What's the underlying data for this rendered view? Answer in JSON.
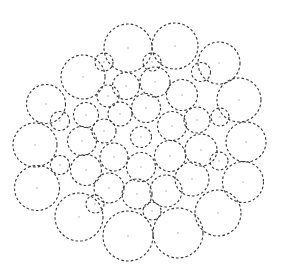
{
  "figure": {
    "name": "circle-packing-diagram",
    "type": "circle-packing",
    "canvas": {
      "width": 288,
      "height": 273,
      "background": "#ffffff"
    },
    "style": {
      "stroke_color": "#3a3a3a",
      "stroke_width": 1.15,
      "dash_pattern": "2.6 2.2",
      "fill": "none",
      "center_dot_color": "#c8c8c8",
      "center_dot_radius": 0.9
    },
    "circle_count": 43,
    "radius_range": [
      8.5,
      26.0
    ],
    "packing_center": [
      141,
      137
    ],
    "packing_radius": 131,
    "circles": [
      {
        "id": "c-center",
        "cx": 141,
        "cy": 137,
        "r": 10.5,
        "ring": 0
      },
      {
        "id": "c-r1-01",
        "cx": 120,
        "cy": 114,
        "r": 12.0,
        "ring": 1
      },
      {
        "id": "c-r1-02",
        "cx": 146,
        "cy": 108,
        "r": 14.5,
        "ring": 1
      },
      {
        "id": "c-r1-03",
        "cx": 172,
        "cy": 126,
        "r": 14.5,
        "ring": 1
      },
      {
        "id": "c-r1-04",
        "cx": 170,
        "cy": 156,
        "r": 15.5,
        "ring": 1
      },
      {
        "id": "c-r1-05",
        "cx": 141,
        "cy": 167,
        "r": 14.5,
        "ring": 1
      },
      {
        "id": "c-r1-06",
        "cx": 114,
        "cy": 157,
        "r": 14.0,
        "ring": 1
      },
      {
        "id": "c-r1-07",
        "cx": 104,
        "cy": 131,
        "r": 12.0,
        "ring": 1
      },
      {
        "id": "c-r2-01",
        "cx": 108,
        "cy": 96,
        "r": 11.0,
        "ring": 2
      },
      {
        "id": "c-r2-02",
        "cx": 126,
        "cy": 86,
        "r": 13.5,
        "ring": 2
      },
      {
        "id": "c-r2-03",
        "cx": 155,
        "cy": 82,
        "r": 15.0,
        "ring": 2
      },
      {
        "id": "c-r2-04",
        "cx": 182,
        "cy": 95,
        "r": 15.5,
        "ring": 2
      },
      {
        "id": "c-r2-05",
        "cx": 197,
        "cy": 120,
        "r": 13.0,
        "ring": 2
      },
      {
        "id": "c-r2-06",
        "cx": 201,
        "cy": 150,
        "r": 16.0,
        "ring": 2
      },
      {
        "id": "c-r2-07",
        "cx": 192,
        "cy": 179,
        "r": 17.0,
        "ring": 2
      },
      {
        "id": "c-r2-08",
        "cx": 166,
        "cy": 191,
        "r": 16.0,
        "ring": 2
      },
      {
        "id": "c-r2-09",
        "cx": 137,
        "cy": 194,
        "r": 15.0,
        "ring": 2
      },
      {
        "id": "c-r2-10",
        "cx": 109,
        "cy": 188,
        "r": 15.0,
        "ring": 2
      },
      {
        "id": "c-r2-11",
        "cx": 86,
        "cy": 170,
        "r": 15.5,
        "ring": 2
      },
      {
        "id": "c-r2-12",
        "cx": 82,
        "cy": 141,
        "r": 14.5,
        "ring": 2
      },
      {
        "id": "c-r2-13",
        "cx": 86,
        "cy": 115,
        "r": 12.5,
        "ring": 2
      },
      {
        "id": "c-r3-01",
        "cx": 83,
        "cy": 77,
        "r": 22.0,
        "ring": 3
      },
      {
        "id": "c-r3-02",
        "cx": 128,
        "cy": 48,
        "r": 24.0,
        "ring": 3
      },
      {
        "id": "c-r3-03",
        "cx": 175,
        "cy": 46,
        "r": 23.0,
        "ring": 3
      },
      {
        "id": "c-r3-04",
        "cx": 219,
        "cy": 63,
        "r": 21.0,
        "ring": 3
      },
      {
        "id": "c-r3-05",
        "cx": 239,
        "cy": 100,
        "r": 22.0,
        "ring": 3
      },
      {
        "id": "c-r3-06",
        "cx": 246,
        "cy": 142,
        "r": 20.0,
        "ring": 3
      },
      {
        "id": "c-r3-07",
        "cx": 243,
        "cy": 182,
        "r": 20.5,
        "ring": 3
      },
      {
        "id": "c-r3-08",
        "cx": 218,
        "cy": 213,
        "r": 23.0,
        "ring": 3
      },
      {
        "id": "c-r3-09",
        "cx": 178,
        "cy": 233,
        "r": 25.0,
        "ring": 3
      },
      {
        "id": "c-r3-10",
        "cx": 128,
        "cy": 236,
        "r": 25.0,
        "ring": 3
      },
      {
        "id": "c-r3-11",
        "cx": 79,
        "cy": 217,
        "r": 24.0,
        "ring": 3
      },
      {
        "id": "c-r3-12",
        "cx": 37,
        "cy": 188,
        "r": 22.5,
        "ring": 3
      },
      {
        "id": "c-r3-13",
        "cx": 35,
        "cy": 145,
        "r": 22.0,
        "ring": 3
      },
      {
        "id": "c-r3-14",
        "cx": 46,
        "cy": 104,
        "r": 19.5,
        "ring": 3
      },
      {
        "id": "c-f-01",
        "cx": 104,
        "cy": 62,
        "r": 9.0,
        "ring": 4
      },
      {
        "id": "c-f-02",
        "cx": 152,
        "cy": 62,
        "r": 9.0,
        "ring": 4
      },
      {
        "id": "c-f-03",
        "cx": 201,
        "cy": 72,
        "r": 9.5,
        "ring": 4
      },
      {
        "id": "c-f-04",
        "cx": 220,
        "cy": 117,
        "r": 9.0,
        "ring": 4
      },
      {
        "id": "c-f-05",
        "cx": 219,
        "cy": 161,
        "r": 9.0,
        "ring": 4
      },
      {
        "id": "c-f-06",
        "cx": 152,
        "cy": 211,
        "r": 9.0,
        "ring": 4
      },
      {
        "id": "c-f-07",
        "cx": 95,
        "cy": 204,
        "r": 9.0,
        "ring": 4
      },
      {
        "id": "c-f-08",
        "cx": 60,
        "cy": 165,
        "r": 9.5,
        "ring": 4
      },
      {
        "id": "c-f-09",
        "cx": 60,
        "cy": 121,
        "r": 9.5,
        "ring": 4
      }
    ]
  }
}
